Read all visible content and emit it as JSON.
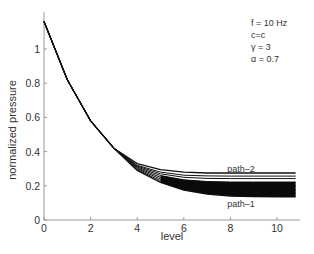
{
  "chart_data": {
    "type": "line",
    "title": "",
    "xlabel": "level",
    "ylabel": "normalized pressure",
    "xlim": [
      0,
      11
    ],
    "ylim": [
      0,
      1.2
    ],
    "xticks": [
      0,
      2,
      4,
      6,
      8,
      10
    ],
    "yticks": [
      0,
      0.2,
      0.4,
      0.6,
      0.8,
      1
    ],
    "ytick_labels": [
      "0",
      "0.2",
      "0.4",
      "0.6",
      "0.8",
      "1"
    ],
    "xtick_labels": [
      "0",
      "2",
      "4",
      "6",
      "8",
      "10"
    ],
    "grid": false,
    "legend": null,
    "parameters": [
      "f = 10 Hz",
      "c=c",
      "γ = 3",
      "α = 0.7"
    ],
    "annotations": [
      {
        "text": "path–2",
        "x": 8.4,
        "y": 0.3
      },
      {
        "text": "path–1",
        "x": 8.4,
        "y": 0.1
      }
    ],
    "x": [
      0,
      1,
      2,
      3,
      4,
      5,
      6,
      7,
      8,
      9,
      10,
      11
    ],
    "series": [
      {
        "name": "path-2",
        "values": [
          1.16,
          0.82,
          0.58,
          0.42,
          0.33,
          0.295,
          0.28,
          0.275,
          0.275,
          0.275,
          0.275,
          0.275
        ]
      },
      {
        "name": "path-mid-a",
        "values": [
          1.16,
          0.82,
          0.58,
          0.42,
          0.32,
          0.28,
          0.262,
          0.258,
          0.257,
          0.257,
          0.257,
          0.257
        ]
      },
      {
        "name": "path-mid-b",
        "values": [
          1.16,
          0.82,
          0.58,
          0.42,
          0.315,
          0.27,
          0.25,
          0.243,
          0.242,
          0.242,
          0.242,
          0.242
        ]
      },
      {
        "name": "path-mid-c",
        "values": [
          1.16,
          0.82,
          0.58,
          0.42,
          0.31,
          0.26,
          0.235,
          0.225,
          0.222,
          0.222,
          0.222,
          0.222
        ]
      },
      {
        "name": "path-mid-d",
        "values": [
          1.16,
          0.82,
          0.58,
          0.42,
          0.305,
          0.25,
          0.22,
          0.205,
          0.2,
          0.2,
          0.2,
          0.2
        ]
      },
      {
        "name": "path-mid-e",
        "values": [
          1.16,
          0.82,
          0.58,
          0.42,
          0.3,
          0.24,
          0.205,
          0.185,
          0.178,
          0.176,
          0.176,
          0.176
        ]
      },
      {
        "name": "path-mid-f",
        "values": [
          1.16,
          0.82,
          0.58,
          0.42,
          0.295,
          0.23,
          0.19,
          0.168,
          0.158,
          0.155,
          0.155,
          0.155
        ]
      },
      {
        "name": "path-1",
        "values": [
          1.16,
          0.82,
          0.58,
          0.42,
          0.29,
          0.22,
          0.175,
          0.152,
          0.14,
          0.136,
          0.135,
          0.135
        ]
      }
    ]
  }
}
